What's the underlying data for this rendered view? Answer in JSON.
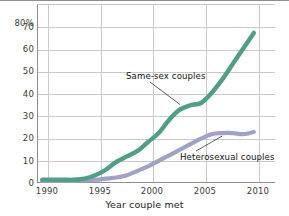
{
  "chart_data": {
    "type": "line",
    "title": "",
    "xlabel": "Year couple met",
    "ylabel": "",
    "xlim": [
      1988.5,
      2011.0
    ],
    "ylim": [
      0,
      80
    ],
    "grid": true,
    "legend_position": "inline-annotations",
    "x_ticks": [
      "1990",
      "1995",
      "2000",
      "2005",
      "2010"
    ],
    "x_tick_values": [
      1990,
      1995,
      2000,
      2005,
      2010
    ],
    "y_ticks": [
      "0",
      "10",
      "20",
      "30",
      "40",
      "50",
      "60",
      "70",
      "80%"
    ],
    "y_tick_values": [
      0,
      10,
      20,
      30,
      40,
      50,
      60,
      70,
      80
    ],
    "colors": {
      "same_sex": "#4f9e87",
      "heterosexual": "#a0a1c8",
      "grid": "#c9c9c9",
      "axis": "#8d8d8d",
      "text": "#333333"
    },
    "series": [
      {
        "name": "Same-sex couples",
        "color": "#4f9e87",
        "x": [
          1989,
          1990,
          1991,
          1992,
          1993,
          1994,
          1995,
          1996,
          1997,
          1998,
          1999,
          2000,
          2001,
          2002,
          2003,
          2004,
          2005,
          2006,
          2007,
          2008,
          2009
        ],
        "values": [
          1,
          1,
          1,
          1,
          1.5,
          3,
          5.5,
          9,
          11.5,
          14,
          18,
          22,
          28,
          32.5,
          34.5,
          35.5,
          40,
          46,
          53,
          60,
          67
        ]
      },
      {
        "name": "Heterosexual couples",
        "color": "#a0a1c8",
        "x": [
          1989,
          1990,
          1991,
          1992,
          1993,
          1994,
          1995,
          1996,
          1997,
          1998,
          1999,
          2000,
          2001,
          2002,
          2003,
          2004,
          2005,
          2006,
          2007,
          2008,
          2009
        ],
        "values": [
          0.5,
          0.5,
          0.5,
          0.5,
          0.8,
          1,
          1.5,
          2,
          3,
          5,
          7,
          9.5,
          12,
          14.5,
          17,
          19.5,
          21.5,
          22,
          22,
          21.5,
          22.5
        ]
      }
    ],
    "annotations": [
      {
        "text": "Same-sex couples",
        "target_x": 2002,
        "target_y": 34
      },
      {
        "text": "Heterosexual couples",
        "target_x": 2006,
        "target_y": 22
      }
    ]
  }
}
